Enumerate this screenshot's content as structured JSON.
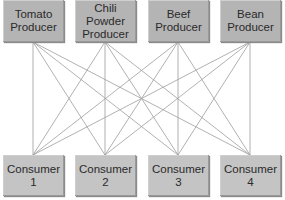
{
  "producers": [
    {
      "label": "Tomato\nProducer"
    },
    {
      "label": "Chili\nPowder\nProducer"
    },
    {
      "label": "Beef\nProducer"
    },
    {
      "label": "Bean\nProducer"
    }
  ],
  "consumers": [
    {
      "label": "Consumer\n1"
    },
    {
      "label": "Consumer\n2"
    },
    {
      "label": "Consumer\n3"
    },
    {
      "label": "Consumer\n4"
    }
  ],
  "connections": "every producer connected to every consumer",
  "colors": {
    "producer_fill": "#b4b4b4",
    "consumer_fill": "#c4c4c4",
    "line": "#9a9a9a"
  }
}
